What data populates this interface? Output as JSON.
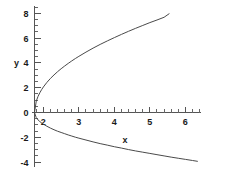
{
  "chart_data": {
    "type": "line",
    "title": "",
    "subtitle": "",
    "xlabel": "x",
    "ylabel": "y",
    "xlim": [
      1.55,
      6.45
    ],
    "ylim": [
      -4.4,
      8.6
    ],
    "grid": false,
    "legend": null,
    "x_ticks_major": [
      2,
      3,
      4,
      5,
      6
    ],
    "x_tick_labels": [
      "2",
      "3",
      "4",
      "5",
      "6"
    ],
    "y_ticks_major": [
      -4,
      -2,
      0,
      2,
      4,
      6,
      8
    ],
    "y_tick_labels": [
      "-4",
      "-2",
      "0",
      "2",
      "4",
      "6",
      "8"
    ],
    "x_minor_step": 0.2,
    "y_minor_step": 0.5,
    "axis_origin": {
      "x": 1.75,
      "y": 0
    },
    "vertex": {
      "x": 1.75,
      "y": 0
    },
    "curve_color": "#4a4a4a",
    "axis_color": "#555555",
    "background": "#ffffff",
    "series": [
      {
        "name": "upper-branch",
        "points": [
          [
            1.75,
            0.0
          ],
          [
            1.8,
            0.92
          ],
          [
            1.85,
            1.3
          ],
          [
            1.9,
            1.59
          ],
          [
            1.95,
            1.84
          ],
          [
            2.0,
            2.06
          ],
          [
            2.1,
            2.43
          ],
          [
            2.2,
            2.75
          ],
          [
            2.3,
            3.03
          ],
          [
            2.4,
            3.29
          ],
          [
            2.5,
            3.53
          ],
          [
            2.6,
            3.75
          ],
          [
            2.7,
            3.96
          ],
          [
            2.8,
            4.16
          ],
          [
            2.9,
            4.35
          ],
          [
            3.0,
            4.53
          ],
          [
            3.2,
            4.87
          ],
          [
            3.4,
            5.19
          ],
          [
            3.6,
            5.49
          ],
          [
            3.8,
            5.77
          ],
          [
            4.0,
            6.04
          ],
          [
            4.2,
            6.3
          ],
          [
            4.4,
            6.55
          ],
          [
            4.6,
            6.79
          ],
          [
            4.8,
            7.02
          ],
          [
            5.0,
            7.25
          ],
          [
            5.2,
            7.46
          ],
          [
            5.4,
            7.68
          ],
          [
            5.55,
            7.98
          ]
        ]
      },
      {
        "name": "lower-branch",
        "points": [
          [
            1.75,
            0.0
          ],
          [
            1.8,
            -0.42
          ],
          [
            1.85,
            -0.6
          ],
          [
            1.9,
            -0.73
          ],
          [
            1.95,
            -0.84
          ],
          [
            2.0,
            -0.94
          ],
          [
            2.1,
            -1.11
          ],
          [
            2.2,
            -1.26
          ],
          [
            2.3,
            -1.39
          ],
          [
            2.4,
            -1.51
          ],
          [
            2.5,
            -1.61
          ],
          [
            2.6,
            -1.71
          ],
          [
            2.7,
            -1.81
          ],
          [
            2.8,
            -1.9
          ],
          [
            2.9,
            -1.99
          ],
          [
            3.0,
            -2.07
          ],
          [
            3.2,
            -2.22
          ],
          [
            3.4,
            -2.37
          ],
          [
            3.6,
            -2.51
          ],
          [
            3.8,
            -2.63
          ],
          [
            4.0,
            -2.76
          ],
          [
            4.2,
            -2.87
          ],
          [
            4.4,
            -2.99
          ],
          [
            4.6,
            -3.1
          ],
          [
            4.8,
            -3.2
          ],
          [
            5.0,
            -3.3
          ],
          [
            5.2,
            -3.4
          ],
          [
            5.4,
            -3.5
          ],
          [
            5.6,
            -3.6
          ],
          [
            5.8,
            -3.69
          ],
          [
            6.0,
            -3.78
          ],
          [
            6.2,
            -3.87
          ],
          [
            6.35,
            -3.94
          ]
        ]
      }
    ]
  }
}
